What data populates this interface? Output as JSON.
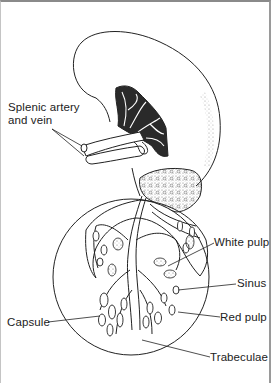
{
  "figure": {
    "labels": {
      "splenic_vessels_line1": "Splenic artery",
      "splenic_vessels_line2": "and vein",
      "white_pulp": "White pulp",
      "sinus": "Sinus",
      "capsule": "Capsule",
      "red_pulp": "Red pulp",
      "trabeculae": "Trabeculae"
    },
    "colors": {
      "ink": "#222222",
      "stipple": "#9a9a9a",
      "background": "#ffffff"
    }
  }
}
